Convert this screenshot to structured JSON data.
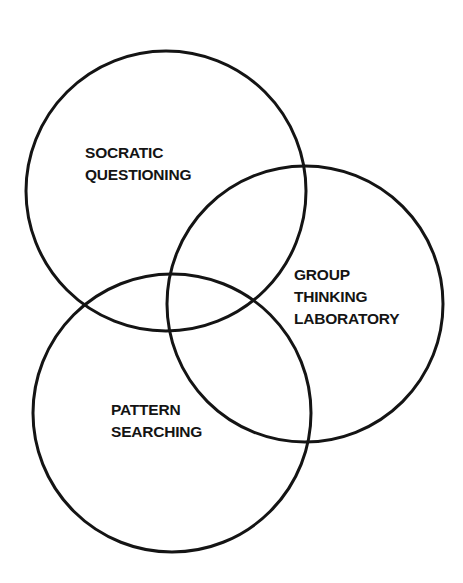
{
  "diagram": {
    "type": "venn",
    "stroke_color": "#141414",
    "background": "#ffffff",
    "circles": [
      {
        "id": "socratic-questioning",
        "cx": 166,
        "cy": 191,
        "r": 140,
        "label_lines": [
          "SOCRATIC",
          "QUESTIONING"
        ]
      },
      {
        "id": "group-thinking-laboratory",
        "cx": 305,
        "cy": 304,
        "r": 138,
        "label_lines": [
          "GROUP",
          "THINKING",
          "LABORATORY"
        ]
      },
      {
        "id": "pattern-searching",
        "cx": 172,
        "cy": 413,
        "r": 139,
        "label_lines": [
          "PATTERN",
          "SEARCHING"
        ]
      }
    ]
  }
}
